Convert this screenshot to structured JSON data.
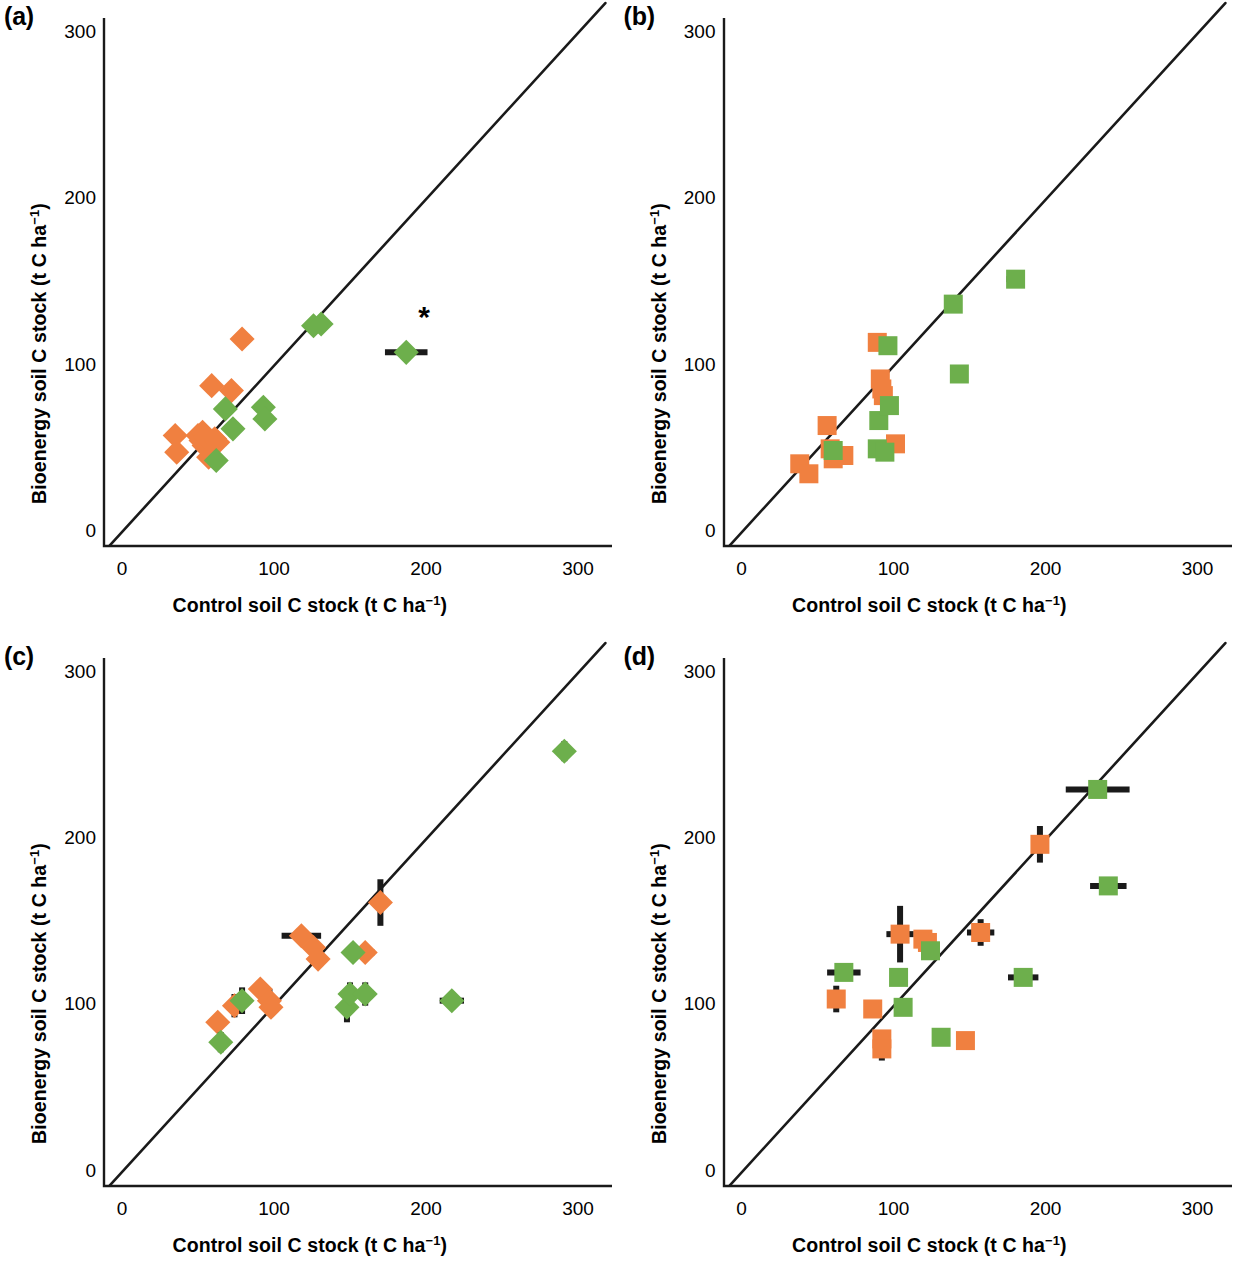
{
  "figure": {
    "type": "multi-panel-scatter",
    "panel_count": 4,
    "background": "#ffffff",
    "colors": {
      "orange": "#F08040",
      "green": "#6DAF4C",
      "line": "#1a1a1a",
      "errorbar": "#1a1a1a",
      "text": "#000000"
    }
  },
  "axes": {
    "xlabel_main": "Control soil C stock (t C ha",
    "xlabel_sup": "−1",
    "xlabel_tail": ")",
    "ylabel_main": "Bioenergy soil C stock (t C ha",
    "ylabel_sup": "−1",
    "ylabel_tail": ")",
    "xticks": [
      "0",
      "100",
      "200",
      "300"
    ],
    "yticks": [
      "0",
      "100",
      "200",
      "300"
    ],
    "xlim": [
      -15,
      320
    ],
    "ylim": [
      -22,
      320
    ],
    "xtickvals": [
      0,
      100,
      200,
      300
    ],
    "ytickvals": [
      0,
      100,
      200,
      300
    ],
    "grid": false,
    "identity_line": true
  },
  "panels": [
    {
      "id": "a",
      "label": "(a)",
      "marker": "diamond",
      "annotation": {
        "symbol": "*",
        "x": 187,
        "y": 130
      },
      "chart_data": {
        "type": "scatter",
        "title": "(a)",
        "xlabel": "Control soil C stock (t C ha−1)",
        "ylabel": "Bioenergy soil C stock (t C ha−1)",
        "xlim": [
          -15,
          320
        ],
        "ylim": [
          -22,
          320
        ],
        "marker": "diamond",
        "series": [
          {
            "name": "orange",
            "color": "#F08040",
            "points": [
              {
                "x": 35,
                "y": 58,
                "xerr": 0,
                "yerr": 0
              },
              {
                "x": 36,
                "y": 48,
                "xerr": 0,
                "yerr": 0
              },
              {
                "x": 50,
                "y": 58,
                "xerr": 0,
                "yerr": 0
              },
              {
                "x": 52,
                "y": 55,
                "xerr": 0,
                "yerr": 0
              },
              {
                "x": 53,
                "y": 60,
                "xerr": 0,
                "yerr": 0
              },
              {
                "x": 54,
                "y": 52,
                "xerr": 0,
                "yerr": 0
              },
              {
                "x": 55,
                "y": 57,
                "xerr": 0,
                "yerr": 0
              },
              {
                "x": 57,
                "y": 45,
                "xerr": 0,
                "yerr": 0
              },
              {
                "x": 59,
                "y": 88,
                "xerr": 0,
                "yerr": 0
              },
              {
                "x": 61,
                "y": 56,
                "xerr": 0,
                "yerr": 0
              },
              {
                "x": 63,
                "y": 54,
                "xerr": 0,
                "yerr": 0
              },
              {
                "x": 72,
                "y": 85,
                "xerr": 0,
                "yerr": 0
              },
              {
                "x": 79,
                "y": 116,
                "xerr": 0,
                "yerr": 1
              }
            ]
          },
          {
            "name": "green",
            "color": "#6DAF4C",
            "points": [
              {
                "x": 62,
                "y": 43,
                "xerr": 0,
                "yerr": 0
              },
              {
                "x": 68,
                "y": 74,
                "xerr": 0,
                "yerr": 0
              },
              {
                "x": 73,
                "y": 62,
                "xerr": 0,
                "yerr": 0
              },
              {
                "x": 93,
                "y": 75,
                "xerr": 0,
                "yerr": 0
              },
              {
                "x": 94,
                "y": 68,
                "xerr": 0,
                "yerr": 0
              },
              {
                "x": 126,
                "y": 124,
                "xerr": 0,
                "yerr": 0
              },
              {
                "x": 131,
                "y": 125,
                "xerr": 0,
                "yerr": 0
              },
              {
                "x": 187,
                "y": 108,
                "xerr": 14,
                "yerr": 0
              }
            ]
          }
        ]
      }
    },
    {
      "id": "b",
      "label": "(b)",
      "marker": "square",
      "annotation": null,
      "chart_data": {
        "type": "scatter",
        "title": "(b)",
        "xlabel": "Control soil C stock (t C ha−1)",
        "ylabel": "Bioenergy soil C stock (t C ha−1)",
        "xlim": [
          -15,
          320
        ],
        "ylim": [
          -22,
          320
        ],
        "marker": "square",
        "series": [
          {
            "name": "orange",
            "color": "#F08040",
            "points": [
              {
                "x": 38,
                "y": 41,
                "xerr": 0,
                "yerr": 0
              },
              {
                "x": 44,
                "y": 35,
                "xerr": 0,
                "yerr": 0
              },
              {
                "x": 56,
                "y": 64,
                "xerr": 0,
                "yerr": 0
              },
              {
                "x": 58,
                "y": 50,
                "xerr": 0,
                "yerr": 0
              },
              {
                "x": 60,
                "y": 44,
                "xerr": 0,
                "yerr": 0
              },
              {
                "x": 67,
                "y": 46,
                "xerr": 0,
                "yerr": 0
              },
              {
                "x": 89,
                "y": 114,
                "xerr": 2,
                "yerr": 2
              },
              {
                "x": 91,
                "y": 92,
                "xerr": 0,
                "yerr": 0
              },
              {
                "x": 92,
                "y": 86,
                "xerr": 1,
                "yerr": 1
              },
              {
                "x": 93,
                "y": 82,
                "xerr": 0,
                "yerr": 0
              },
              {
                "x": 101,
                "y": 53,
                "xerr": 0,
                "yerr": 0
              }
            ]
          },
          {
            "name": "green",
            "color": "#6DAF4C",
            "points": [
              {
                "x": 60,
                "y": 49,
                "xerr": 0,
                "yerr": 0
              },
              {
                "x": 89,
                "y": 50,
                "xerr": 0,
                "yerr": 0
              },
              {
                "x": 90,
                "y": 67,
                "xerr": 0,
                "yerr": 0
              },
              {
                "x": 94,
                "y": 48,
                "xerr": 0,
                "yerr": 0
              },
              {
                "x": 96,
                "y": 112,
                "xerr": 1,
                "yerr": 1
              },
              {
                "x": 97,
                "y": 76,
                "xerr": 2,
                "yerr": 1
              },
              {
                "x": 143,
                "y": 95,
                "xerr": 0,
                "yerr": 0
              },
              {
                "x": 139,
                "y": 137,
                "xerr": 3,
                "yerr": 3
              },
              {
                "x": 180,
                "y": 152,
                "xerr": 6,
                "yerr": 3
              }
            ]
          }
        ]
      }
    },
    {
      "id": "c",
      "label": "(c)",
      "marker": "diamond",
      "annotation": null,
      "chart_data": {
        "type": "scatter",
        "title": "(c)",
        "xlabel": "Control soil C stock (t C ha−1)",
        "ylabel": "Bioenergy soil C stock (t C ha−1)",
        "xlim": [
          -15,
          320
        ],
        "ylim": [
          -22,
          320
        ],
        "marker": "diamond",
        "series": [
          {
            "name": "orange",
            "color": "#F08040",
            "points": [
              {
                "x": 63,
                "y": 90,
                "xerr": 0,
                "yerr": 5
              },
              {
                "x": 74,
                "y": 100,
                "xerr": 0,
                "yerr": 7
              },
              {
                "x": 91,
                "y": 110,
                "xerr": 0,
                "yerr": 0
              },
              {
                "x": 97,
                "y": 103,
                "xerr": 0,
                "yerr": 7
              },
              {
                "x": 98,
                "y": 99,
                "xerr": 0,
                "yerr": 0
              },
              {
                "x": 118,
                "y": 142,
                "xerr": 13,
                "yerr": 5
              },
              {
                "x": 126,
                "y": 135,
                "xerr": 0,
                "yerr": 4
              },
              {
                "x": 129,
                "y": 128,
                "xerr": 0,
                "yerr": 4
              },
              {
                "x": 160,
                "y": 132,
                "xerr": 6,
                "yerr": 0
              },
              {
                "x": 170,
                "y": 162,
                "xerr": 4,
                "yerr": 14
              }
            ]
          },
          {
            "name": "green",
            "color": "#6DAF4C",
            "points": [
              {
                "x": 65,
                "y": 78,
                "xerr": 0,
                "yerr": 6
              },
              {
                "x": 79,
                "y": 103,
                "xerr": 0,
                "yerr": 8
              },
              {
                "x": 148,
                "y": 99,
                "xerr": 0,
                "yerr": 9
              },
              {
                "x": 150,
                "y": 107,
                "xerr": 0,
                "yerr": 7
              },
              {
                "x": 152,
                "y": 132,
                "xerr": 0,
                "yerr": 0
              },
              {
                "x": 160,
                "y": 107,
                "xerr": 0,
                "yerr": 7
              },
              {
                "x": 217,
                "y": 103,
                "xerr": 8,
                "yerr": 0
              },
              {
                "x": 291,
                "y": 253,
                "xerr": 0,
                "yerr": 6
              }
            ]
          }
        ]
      }
    },
    {
      "id": "d",
      "label": "(d)",
      "marker": "square",
      "annotation": null,
      "chart_data": {
        "type": "scatter",
        "title": "(d)",
        "xlabel": "Control soil C stock (t C ha−1)",
        "ylabel": "Bioenergy soil C stock (t C ha−1)",
        "xlim": [
          -15,
          320
        ],
        "ylim": [
          -22,
          320
        ],
        "marker": "square",
        "series": [
          {
            "name": "orange",
            "color": "#F08040",
            "points": [
              {
                "x": 62,
                "y": 104,
                "xerr": 0,
                "yerr": 8
              },
              {
                "x": 86,
                "y": 98,
                "xerr": 0,
                "yerr": 0
              },
              {
                "x": 92,
                "y": 80,
                "xerr": 0,
                "yerr": 0
              },
              {
                "x": 92,
                "y": 74,
                "xerr": 0,
                "yerr": 7
              },
              {
                "x": 104,
                "y": 143,
                "xerr": 9,
                "yerr": 17
              },
              {
                "x": 119,
                "y": 140,
                "xerr": 0,
                "yerr": 0
              },
              {
                "x": 122,
                "y": 138,
                "xerr": 0,
                "yerr": 0
              },
              {
                "x": 147,
                "y": 79,
                "xerr": 0,
                "yerr": 0
              },
              {
                "x": 157,
                "y": 144,
                "xerr": 9,
                "yerr": 8
              },
              {
                "x": 196,
                "y": 197,
                "xerr": 0,
                "yerr": 11
              }
            ]
          },
          {
            "name": "green",
            "color": "#6DAF4C",
            "points": [
              {
                "x": 67,
                "y": 120,
                "xerr": 11,
                "yerr": 0
              },
              {
                "x": 103,
                "y": 117,
                "xerr": 0,
                "yerr": 0
              },
              {
                "x": 106,
                "y": 99,
                "xerr": 0,
                "yerr": 0
              },
              {
                "x": 124,
                "y": 133,
                "xerr": 0,
                "yerr": 0
              },
              {
                "x": 131,
                "y": 81,
                "xerr": 4,
                "yerr": 0
              },
              {
                "x": 185,
                "y": 117,
                "xerr": 10,
                "yerr": 4
              },
              {
                "x": 234,
                "y": 230,
                "xerr": 21,
                "yerr": 0
              },
              {
                "x": 241,
                "y": 172,
                "xerr": 12,
                "yerr": 4
              }
            ]
          }
        ]
      }
    }
  ]
}
